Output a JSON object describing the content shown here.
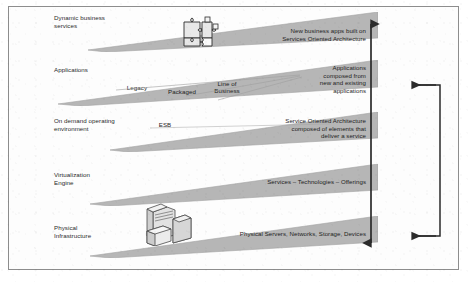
{
  "diagram": {
    "background_color": "#ffffff",
    "slab_color": "#b4b4b4",
    "slab_edge_color": "#9a9a9a",
    "line_color": "#2b2b2b",
    "frame_color": "#8d8d8d"
  },
  "layers": [
    {
      "id": "dynamic-business-services",
      "label": "Dynamic business\nservices",
      "description": "New business apps built on\nServices Oriented Architecture",
      "icon": "puzzle-pieces-icon",
      "tags": []
    },
    {
      "id": "applications",
      "label": "Applications",
      "description": "Applications\ncomposed from\nnew and existing\napplications",
      "icon": "",
      "tags": [
        "Legacy",
        "Packaged",
        "Line of\nBusiness"
      ]
    },
    {
      "id": "on-demand-operating-environment",
      "label": "On demand operating\nenvironment",
      "description": "Service Oriented Architecture\ncomposed of elements that\ndeliver a service",
      "icon": "",
      "tags": [
        "ESB"
      ]
    },
    {
      "id": "virtualization-engine",
      "label": "Virtualization\nEngine",
      "description": "Services – Technologies – Offerings",
      "icon": "",
      "tags": []
    },
    {
      "id": "physical-infrastructure",
      "label": "Physical\nInfrastructure",
      "description": "Physical Servers, Networks, Storage, Devices",
      "icon": "server-stack-icon",
      "tags": []
    }
  ],
  "connectors": [
    {
      "id": "vertical-span-arrow",
      "type": "double-headed-vertical-arrow",
      "from_layer": "dynamic-business-services",
      "to_layer": "physical-infrastructure"
    },
    {
      "id": "feedback-loop-arrow",
      "type": "bracket-with-two-arrowheads",
      "from_layer": "applications",
      "to_layer": "physical-infrastructure"
    }
  ]
}
